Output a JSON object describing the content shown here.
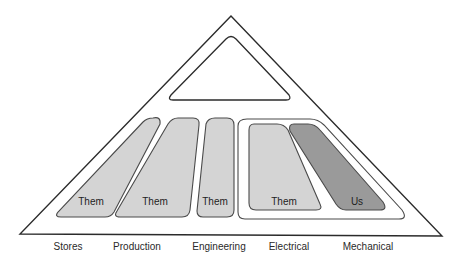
{
  "diagram": {
    "type": "organisational-pyramid",
    "top_box_label": "",
    "departments": [
      {
        "name": "Stores",
        "box_label": "Them",
        "fill": "#d4d4d4"
      },
      {
        "name": "Production",
        "box_label": "Them",
        "fill": "#d4d4d4"
      },
      {
        "name": "Engineering",
        "box_label": "Them",
        "fill": "#d4d4d4"
      },
      {
        "name": "Electrical",
        "box_label": "Them",
        "fill": "#d4d4d4"
      },
      {
        "name": "Mechanical",
        "box_label": "Us",
        "fill": "#9a9a9a"
      }
    ],
    "group": {
      "members": [
        "Electrical",
        "Mechanical"
      ]
    },
    "colors": {
      "outline": "#2b2b2b",
      "them_fill": "#d4d4d4",
      "us_fill": "#9a9a9a",
      "background": "#ffffff"
    }
  }
}
